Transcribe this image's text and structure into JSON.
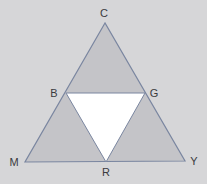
{
  "diagram": {
    "title": "",
    "background_color": "#d6d6d8",
    "fill_color": "#c4c4c8",
    "center_fill_color": "#ffffff",
    "stroke_color": "#7a86a0",
    "vertices": {
      "C": {
        "label": "C",
        "x": 105,
        "y": 23
      },
      "B": {
        "label": "B",
        "x": 66,
        "y": 93
      },
      "G": {
        "label": "G",
        "x": 145,
        "y": 93
      },
      "M": {
        "label": "M",
        "x": 25,
        "y": 162
      },
      "R": {
        "label": "R",
        "x": 106,
        "y": 162
      },
      "Y": {
        "label": "Y",
        "x": 185,
        "y": 161
      }
    },
    "regions": [
      {
        "name": "top-triangle",
        "points": [
          "C",
          "B",
          "G"
        ],
        "fill": "shaded"
      },
      {
        "name": "left-triangle",
        "points": [
          "B",
          "M",
          "R"
        ],
        "fill": "shaded"
      },
      {
        "name": "right-triangle",
        "points": [
          "G",
          "R",
          "Y"
        ],
        "fill": "shaded"
      },
      {
        "name": "center-triangle",
        "points": [
          "B",
          "G",
          "R"
        ],
        "fill": "white"
      }
    ]
  }
}
